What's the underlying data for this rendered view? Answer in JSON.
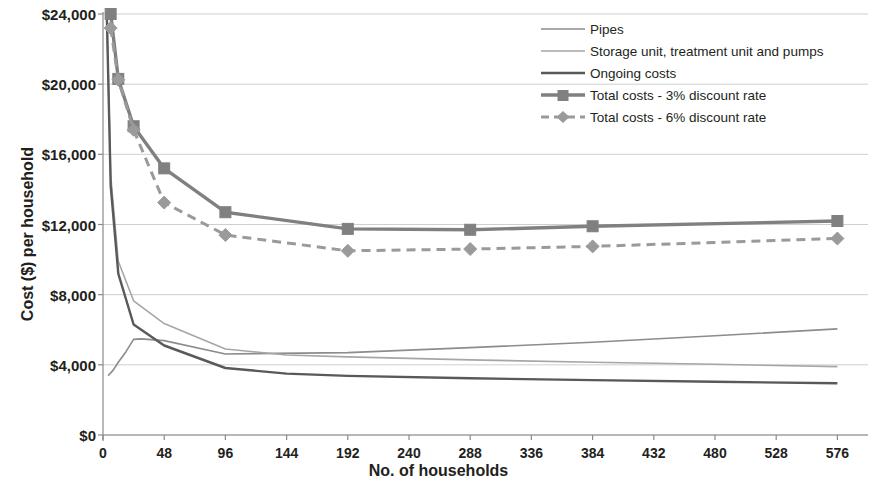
{
  "chart_data": {
    "type": "line",
    "title": "",
    "xlabel": "No. of households",
    "ylabel": "Cost ($)  per household",
    "xlim": [
      0,
      600
    ],
    "ylim": [
      0,
      24000
    ],
    "xticks": [
      0,
      48,
      96,
      144,
      192,
      240,
      288,
      336,
      384,
      432,
      480,
      528,
      576
    ],
    "yticks": [
      0,
      4000,
      8000,
      12000,
      16000,
      20000,
      24000
    ],
    "ytick_labels": [
      "$0",
      "$4,000",
      "$8,000",
      "$12,000",
      "$16,000",
      "$20,000",
      "$24,000"
    ],
    "xtick_labels": [
      "0",
      "48",
      "96",
      "144",
      "192",
      "240",
      "288",
      "336",
      "384",
      "432",
      "480",
      "528",
      "576"
    ],
    "grid": "horizontal",
    "legend_position": "top-right",
    "series": [
      {
        "name": "Pipes",
        "style": "solid-thin",
        "color": "#8c8c8c",
        "markers": "none",
        "x": [
          4,
          8,
          12,
          18,
          24,
          30,
          48,
          96,
          192,
          288,
          384,
          480,
          576
        ],
        "values": [
          3380,
          3700,
          4150,
          4750,
          5450,
          5480,
          5380,
          4620,
          4700,
          4980,
          5290,
          5660,
          6050
        ]
      },
      {
        "name": "Storage unit, treatment unit and pumps",
        "style": "solid-thin",
        "color": "#a6a6a6",
        "markers": "none",
        "x": [
          3,
          6,
          12,
          24,
          48,
          96,
          144,
          192,
          288,
          384,
          480,
          576
        ],
        "values": [
          24000,
          14800,
          9900,
          7650,
          6350,
          4900,
          4560,
          4450,
          4280,
          4150,
          4030,
          3900
        ]
      },
      {
        "name": "Ongoing costs",
        "style": "solid-medium",
        "color": "#595959",
        "markers": "none",
        "x": [
          3,
          6,
          12,
          24,
          48,
          96,
          144,
          192,
          288,
          384,
          480,
          576
        ],
        "values": [
          24000,
          14200,
          9200,
          6300,
          5100,
          3820,
          3500,
          3370,
          3230,
          3130,
          3030,
          2950
        ]
      },
      {
        "name": "Total costs - 3% discount rate",
        "style": "solid-thick",
        "color": "#808080",
        "markers": "square",
        "x": [
          6,
          12,
          24,
          48,
          96,
          192,
          288,
          384,
          576
        ],
        "values": [
          24000,
          20300,
          17600,
          15200,
          12700,
          11750,
          11700,
          11900,
          12200
        ]
      },
      {
        "name": "Total costs - 6% discount rate",
        "style": "dashed-thick",
        "color": "#9a9a9a",
        "markers": "diamond",
        "x": [
          6,
          12,
          24,
          48,
          96,
          192,
          288,
          384,
          576
        ],
        "values": [
          23200,
          20250,
          17400,
          13250,
          11400,
          10500,
          10600,
          10750,
          11200
        ]
      }
    ]
  },
  "legend": {
    "items": [
      {
        "label": "Pipes",
        "key": "line-thin"
      },
      {
        "label": "Storage unit, treatment unit and pumps",
        "key": "line-thin-light"
      },
      {
        "label": "Ongoing costs",
        "key": "line-medium"
      },
      {
        "label": "Total costs - 3% discount rate",
        "key": "line-thick-square"
      },
      {
        "label": "Total costs - 6% discount rate",
        "key": "line-dashed-diamond"
      }
    ]
  },
  "axes": {
    "y_title": "Cost ($)  per household",
    "x_title": "No. of households"
  }
}
